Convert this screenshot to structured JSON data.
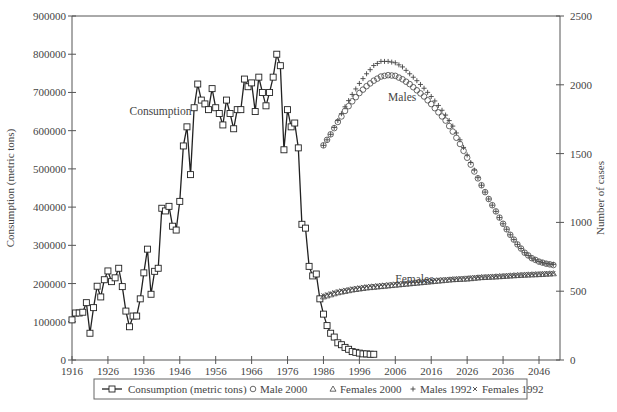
{
  "chart_data": {
    "type": "line",
    "title": "",
    "xlabel": "",
    "ylabel": "Consumption (metric tons)",
    "y2label": "Number of cases",
    "xlim": [
      1916,
      2052
    ],
    "ylim": [
      0,
      900000
    ],
    "y2lim": [
      0,
      2500
    ],
    "grid": false,
    "legend_position": "bottom",
    "x_ticks": [
      1916,
      1926,
      1936,
      1946,
      1956,
      1966,
      1976,
      1986,
      1996,
      2006,
      2016,
      2026,
      2036,
      2046
    ],
    "y_ticks": [
      0,
      100000,
      200000,
      300000,
      400000,
      500000,
      600000,
      700000,
      800000,
      900000
    ],
    "y2_ticks": [
      0,
      500,
      1000,
      1500,
      2000,
      2500
    ],
    "annotations": [
      {
        "text": "Consumption",
        "x": 1932,
        "y": 640000
      },
      {
        "text": "Males",
        "x": 2004,
        "y": 1880
      },
      {
        "text": "Females",
        "x": 2006,
        "y": 560
      }
    ],
    "series": [
      {
        "name": "Consumption (metric tons)",
        "axis": "left",
        "marker": "open-square-line",
        "x": [
          1916,
          1917,
          1918,
          1919,
          1920,
          1921,
          1922,
          1923,
          1924,
          1925,
          1926,
          1927,
          1928,
          1929,
          1930,
          1931,
          1932,
          1933,
          1934,
          1935,
          1936,
          1937,
          1938,
          1939,
          1940,
          1941,
          1942,
          1943,
          1944,
          1945,
          1946,
          1947,
          1948,
          1949,
          1950,
          1951,
          1952,
          1953,
          1954,
          1955,
          1956,
          1957,
          1958,
          1959,
          1960,
          1961,
          1962,
          1963,
          1964,
          1965,
          1966,
          1967,
          1968,
          1969,
          1970,
          1971,
          1972,
          1973,
          1974,
          1975,
          1976,
          1977,
          1978,
          1979,
          1980,
          1981,
          1982,
          1983,
          1984,
          1985,
          1986,
          1987,
          1988,
          1989,
          1990,
          1991,
          1992,
          1993,
          1994,
          1995,
          1996,
          1997,
          1998,
          1999,
          2000
        ],
        "values": [
          105000,
          123000,
          123000,
          125000,
          150000,
          70000,
          137000,
          193000,
          165000,
          210000,
          233000,
          205000,
          215000,
          240000,
          192000,
          128000,
          87000,
          115000,
          115000,
          160000,
          228000,
          290000,
          172000,
          232000,
          240000,
          397000,
          390000,
          402000,
          350000,
          340000,
          415000,
          560000,
          610000,
          485000,
          660000,
          722000,
          680000,
          670000,
          655000,
          710000,
          660000,
          645000,
          615000,
          680000,
          645000,
          605000,
          655000,
          655000,
          735000,
          715000,
          725000,
          650000,
          740000,
          700000,
          665000,
          700000,
          740000,
          800000,
          770000,
          550000,
          655000,
          610000,
          620000,
          555000,
          355000,
          345000,
          245000,
          220000,
          225000,
          160000,
          120000,
          90000,
          70000,
          60000,
          45000,
          40000,
          33000,
          28000,
          22000,
          20000,
          18000,
          16000,
          16000,
          15000,
          15000
        ]
      },
      {
        "name": "Male 2000",
        "axis": "right",
        "marker": "open-circle",
        "x": [
          1986,
          1988,
          1990,
          1992,
          1994,
          1996,
          1998,
          2000,
          2002,
          2004,
          2006,
          2008,
          2010,
          2012,
          2014,
          2016,
          2018,
          2020,
          2022,
          2024,
          2026,
          2028,
          2030,
          2032,
          2034,
          2036,
          2038,
          2040,
          2042,
          2044,
          2046,
          2048,
          2050
        ],
        "values": [
          1560,
          1640,
          1730,
          1810,
          1880,
          1940,
          1990,
          2030,
          2060,
          2070,
          2065,
          2040,
          2005,
          1960,
          1915,
          1860,
          1800,
          1740,
          1660,
          1570,
          1470,
          1370,
          1270,
          1170,
          1080,
          990,
          910,
          840,
          780,
          740,
          715,
          700,
          690
        ]
      },
      {
        "name": "Females 2000",
        "axis": "right",
        "marker": "open-triangle",
        "x": [
          1986,
          1990,
          1994,
          1998,
          2002,
          2006,
          2010,
          2014,
          2018,
          2022,
          2026,
          2030,
          2034,
          2038,
          2042,
          2046,
          2050
        ],
        "values": [
          460,
          490,
          510,
          525,
          535,
          545,
          555,
          565,
          575,
          585,
          590,
          600,
          605,
          612,
          618,
          622,
          628
        ]
      },
      {
        "name": "Males 1992",
        "axis": "right",
        "marker": "plus",
        "x": [
          1986,
          1988,
          1990,
          1992,
          1994,
          1996,
          1998,
          2000,
          2002,
          2004,
          2006,
          2008,
          2010,
          2012,
          2014,
          2016,
          2018,
          2020,
          2022,
          2024,
          2026,
          2028,
          2030,
          2032,
          2034,
          2036,
          2038,
          2040,
          2042,
          2044,
          2046,
          2048,
          2050
        ],
        "values": [
          1560,
          1640,
          1740,
          1840,
          1930,
          2010,
          2080,
          2140,
          2170,
          2170,
          2160,
          2130,
          2080,
          2030,
          1975,
          1915,
          1850,
          1780,
          1700,
          1600,
          1490,
          1380,
          1270,
          1170,
          1080,
          990,
          910,
          840,
          780,
          740,
          715,
          700,
          695
        ]
      },
      {
        "name": "Females 1992",
        "axis": "right",
        "marker": "x",
        "x": [
          1986,
          1990,
          1994,
          1998,
          2002,
          2006,
          2010,
          2014,
          2018,
          2022,
          2026,
          2030,
          2034,
          2038,
          2042,
          2046,
          2050
        ],
        "values": [
          470,
          500,
          520,
          535,
          545,
          555,
          565,
          575,
          585,
          590,
          598,
          605,
          610,
          616,
          622,
          628,
          632
        ]
      }
    ]
  },
  "legend": {
    "items": [
      {
        "label": "Consumption (metric tons)",
        "marker": "open-square-line"
      },
      {
        "label": "Male 2000",
        "marker": "open-circle"
      },
      {
        "label": "Females 2000",
        "marker": "open-triangle"
      },
      {
        "label": "Males 1992",
        "marker": "plus"
      },
      {
        "label": "Females 1992",
        "marker": "x"
      }
    ]
  },
  "colors": {
    "axis": "#555555",
    "consumption_line": "#222222",
    "markers": "#444444",
    "text": "#444444"
  }
}
